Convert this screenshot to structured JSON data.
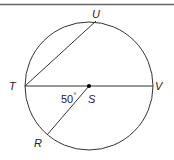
{
  "diagram": {
    "type": "circle-geometry",
    "points": {
      "T": {
        "label": "T"
      },
      "U": {
        "label": "U"
      },
      "V": {
        "label": "V"
      },
      "S": {
        "label": "S"
      },
      "R": {
        "label": "R"
      }
    },
    "angle": {
      "value": "50",
      "unit": "°",
      "at": "S",
      "between": [
        "T",
        "R"
      ]
    },
    "segments": [
      "TV (diameter)",
      "TU (chord)",
      "SR (radius)"
    ],
    "colors": {
      "stroke": "#333333",
      "background": "#ffffff"
    }
  }
}
